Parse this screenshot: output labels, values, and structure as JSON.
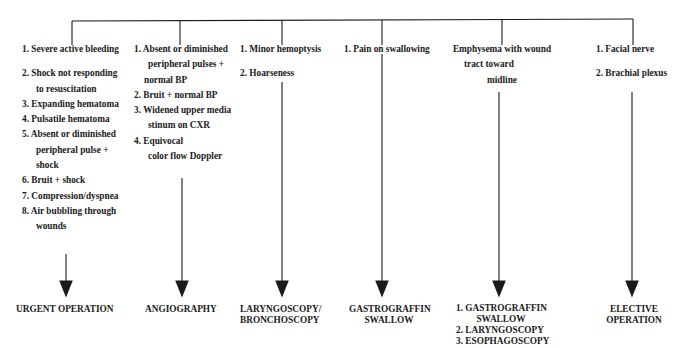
{
  "diagram": {
    "type": "flowchart",
    "columns": [
      {
        "id": "urgent",
        "criteria": [
          {
            "text": "1. Severe active bleeding"
          },
          {
            "text": "2. Shock not responding"
          },
          {
            "text": "to resuscitation"
          },
          {
            "text": "3. Expanding hematoma"
          },
          {
            "text": "4. Pulsatile hematoma"
          },
          {
            "text": "5. Absent or diminished"
          },
          {
            "text": "peripheral pulse +"
          },
          {
            "text": "shock"
          },
          {
            "text": "6. Bruit + shock"
          },
          {
            "text": "7. Compression/dyspnea"
          },
          {
            "text": "8. Air bubbling through"
          },
          {
            "text": "wounds"
          }
        ],
        "outcome": [
          "URGENT OPERATION"
        ]
      },
      {
        "id": "angiography",
        "criteria": [
          {
            "text": "1. Absent or diminished"
          },
          {
            "text": "peripheral pulses +"
          },
          {
            "text": "normal BP"
          },
          {
            "text": "2. Bruit + normal BP"
          },
          {
            "text": "3. Widened upper media"
          },
          {
            "text": "stinum on CXR"
          },
          {
            "text": "4. Equivocal"
          },
          {
            "text": "color flow Doppler"
          }
        ],
        "outcome": [
          "ANGIOGRAPHY"
        ]
      },
      {
        "id": "laryngoscopy",
        "criteria": [
          {
            "text": "1. Minor hemoptysis"
          },
          {
            "text": "2. Hoarseness"
          }
        ],
        "outcome": [
          "LARYNGOSCOPY/",
          "BRONCHOSCOPY"
        ]
      },
      {
        "id": "gastrograffin",
        "criteria": [
          {
            "text": "1. Pain on swallowing"
          }
        ],
        "outcome": [
          "GASTROGRAFFIN",
          "SWALLOW"
        ]
      },
      {
        "id": "emphysema",
        "criteria": [
          {
            "text": "Emphysema with wound"
          },
          {
            "text": "tract toward"
          },
          {
            "text": "midline"
          }
        ],
        "outcome": [
          "1. GASTROGRAFFIN",
          "SWALLOW",
          "2. LARYNGOSCOPY",
          "3. ESOPHAGOSCOPY"
        ]
      },
      {
        "id": "elective",
        "criteria": [
          {
            "text": "1. Facial nerve"
          },
          {
            "text": "2. Brachial plexus"
          }
        ],
        "outcome": [
          "ELECTIVE",
          "OPERATION"
        ]
      }
    ],
    "colors": {
      "line": "#1a1a1a",
      "text": "#1a1a1a",
      "background": "#ffffff"
    }
  }
}
